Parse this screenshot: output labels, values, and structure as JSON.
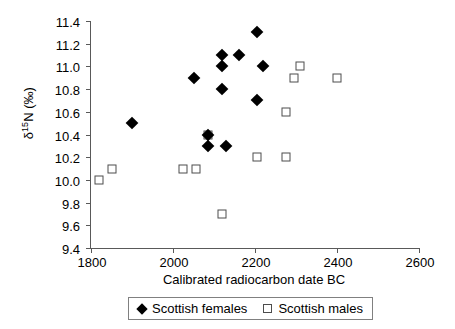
{
  "chart_data": {
    "type": "scatter",
    "title": "",
    "xlabel": "Calibrated radiocarbon date BC",
    "ylabel_html": "δ<sup>15</sup>N (‰)",
    "ylabel_text": "δ15N (‰)",
    "xlim": [
      1800,
      2600
    ],
    "ylim": [
      9.4,
      11.4
    ],
    "xticks": [
      1800,
      2000,
      2200,
      2400,
      2600
    ],
    "yticks": [
      9.4,
      9.6,
      9.8,
      10.0,
      10.2,
      10.4,
      10.6,
      10.8,
      11.0,
      11.2,
      11.4
    ],
    "grid": false,
    "legend_position": "bottom",
    "series": [
      {
        "name": "Scottish females",
        "marker": "filled-diamond",
        "color": "#000000",
        "points": [
          {
            "x": 2205,
            "y": 11.3
          },
          {
            "x": 2120,
            "y": 11.1
          },
          {
            "x": 2160,
            "y": 11.1
          },
          {
            "x": 2120,
            "y": 11.0
          },
          {
            "x": 2220,
            "y": 11.0
          },
          {
            "x": 2050,
            "y": 10.9
          },
          {
            "x": 2120,
            "y": 10.8
          },
          {
            "x": 2205,
            "y": 10.7
          },
          {
            "x": 1900,
            "y": 10.5
          },
          {
            "x": 2085,
            "y": 10.4
          },
          {
            "x": 2085,
            "y": 10.3
          },
          {
            "x": 2130,
            "y": 10.3
          }
        ]
      },
      {
        "name": "Scottish males",
        "marker": "open-square",
        "color": "#4d4d4d",
        "points": [
          {
            "x": 2310,
            "y": 11.0
          },
          {
            "x": 2295,
            "y": 10.9
          },
          {
            "x": 2400,
            "y": 10.9
          },
          {
            "x": 2275,
            "y": 10.6
          },
          {
            "x": 2085,
            "y": 10.4
          },
          {
            "x": 2205,
            "y": 10.2
          },
          {
            "x": 2275,
            "y": 10.2
          },
          {
            "x": 2025,
            "y": 10.1
          },
          {
            "x": 2055,
            "y": 10.1
          },
          {
            "x": 1850,
            "y": 10.1
          },
          {
            "x": 1820,
            "y": 10.0
          },
          {
            "x": 2120,
            "y": 9.7
          }
        ]
      }
    ]
  },
  "legend": {
    "entries": [
      {
        "label": "Scottish females",
        "marker": "filled-diamond"
      },
      {
        "label": "Scottish males",
        "marker": "open-square"
      }
    ]
  }
}
